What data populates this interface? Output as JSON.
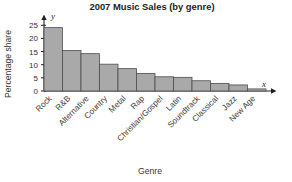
{
  "chart_data": {
    "type": "bar",
    "title": "2007 Music Sales (by genre)",
    "xlabel": "Genre",
    "ylabel": "Percentage share",
    "x_axis_symbol": "x",
    "y_axis_symbol": "y",
    "categories": [
      "Rock",
      "R&B",
      "Alternative",
      "Country",
      "Metal",
      "Rap",
      "Christian/Gospel",
      "Latin",
      "Soundtrack",
      "Classical",
      "Jazz",
      "New Age"
    ],
    "values": [
      24.1,
      15.4,
      14.2,
      10.2,
      8.5,
      6.7,
      5.4,
      5.2,
      3.9,
      2.9,
      2.3,
      0.8
    ],
    "ylim": [
      0,
      27
    ],
    "yticks": [
      0,
      5,
      10,
      15,
      20,
      25
    ],
    "ytick_labels": [
      "0",
      "5",
      "10",
      "15",
      "20",
      "25"
    ],
    "grid": false,
    "legend": null,
    "bar_fill": "#a9a9a9",
    "bar_stroke": "#4d4d4d",
    "axis_color": "#1f1f1f"
  }
}
